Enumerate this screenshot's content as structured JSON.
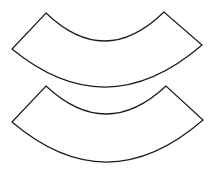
{
  "diagram": {
    "background": "#ffffff",
    "stroke_color": "#1a1a1a",
    "fill_color": "#ffffff",
    "shapes": [
      {
        "name": "top-annular-sector",
        "inner_left": [
          46,
          13
        ],
        "inner_right": [
          164,
          12
        ],
        "outer_left": [
          12,
          49
        ],
        "outer_right": [
          202,
          45
        ],
        "inner_arc_bottom_y": 41,
        "outer_arc_bottom_y": 87
      },
      {
        "name": "bottom-annular-sector",
        "inner_left": [
          46,
          86
        ],
        "inner_right": [
          166,
          86
        ],
        "outer_left": [
          12,
          122
        ],
        "outer_right": [
          203,
          120
        ],
        "inner_arc_bottom_y": 114,
        "outer_arc_bottom_y": 162
      }
    ]
  }
}
